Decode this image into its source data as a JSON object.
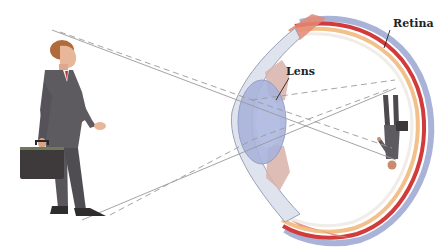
{
  "figure": {
    "labels": {
      "retina": "Retina",
      "lens": "Lens"
    },
    "colors": {
      "background": "#ffffff",
      "ray_line": "#9a9a9a",
      "suit": "#5e5b60",
      "skin": "#e8b79a",
      "hair": "#b06a3c",
      "briefcase": "#3e3a3b",
      "lens_fill": "#a9b4dc",
      "cornea": "#dfe3ee",
      "sclera": "#f1ece8",
      "retina_red": "#d23b3b",
      "choroid_orange": "#f2c08a",
      "outer_blue": "#8c98c9",
      "muscle_pink": "#e58a76"
    },
    "elements": [
      "standing-businessman-with-briefcase",
      "light-rays-solid",
      "light-rays-dashed",
      "eye-cross-section",
      "lens",
      "retina",
      "inverted-image-on-retina"
    ]
  }
}
